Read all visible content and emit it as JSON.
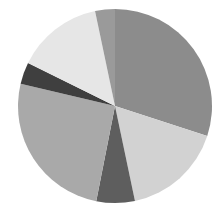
{
  "chart_data": {
    "type": "pie",
    "title": "",
    "start_angle_deg": 0,
    "direction": "clockwise",
    "center": [
      115,
      106
    ],
    "radius": 97,
    "categories": [
      "Slice 1",
      "Slice 2",
      "Slice 3",
      "Slice 4",
      "Slice 5",
      "Slice 6",
      "Slice 7"
    ],
    "values": [
      30.0,
      16.7,
      6.4,
      25.6,
      3.6,
      14.4,
      3.3
    ],
    "colors": [
      "#8c8c8c",
      "#d2d2d2",
      "#5e5e5e",
      "#a9a9a9",
      "#3f3f3f",
      "#e6e6e6",
      "#9a9a9a"
    ],
    "legend": [],
    "labels_shown": false
  }
}
